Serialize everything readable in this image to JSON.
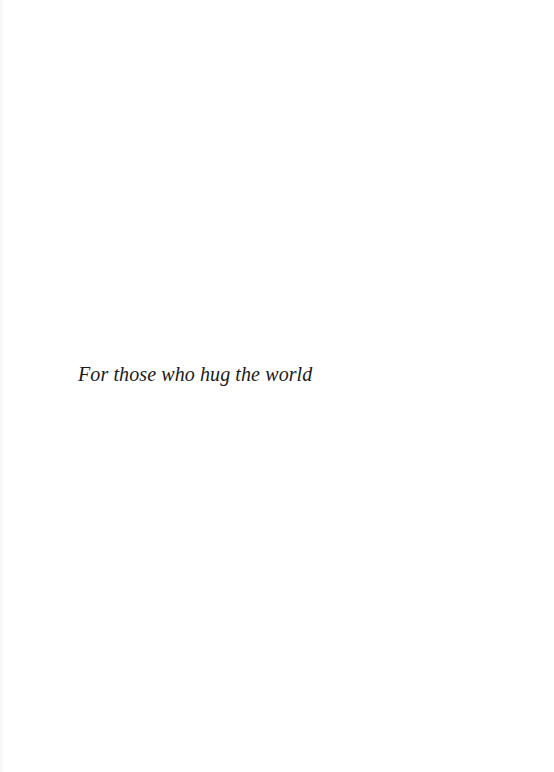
{
  "page": {
    "dedication": "For those who hug the world"
  },
  "colors": {
    "background": "#ffffff",
    "text": "#1a1a1a"
  }
}
